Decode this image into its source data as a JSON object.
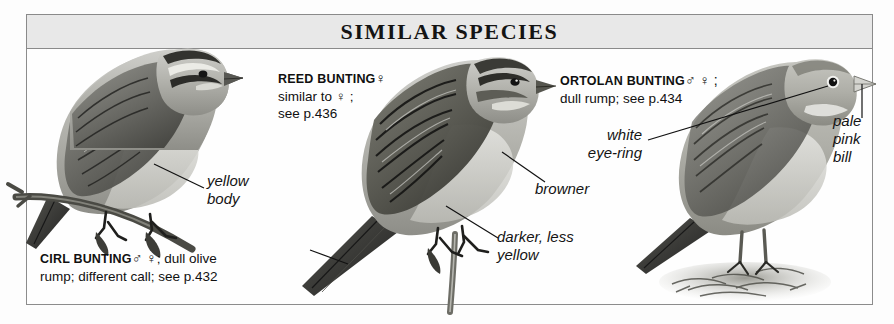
{
  "plate": {
    "header_title": "SIMILAR SPECIES",
    "frame_color": "#8c8c8c",
    "header_bg": "#e8e8e8",
    "page_bg": "#fdfdfd"
  },
  "species": [
    {
      "id": "cirl-bunting",
      "name": "CIRL BUNTING",
      "symbols": "♂ ♀",
      "note_line1": "; dull olive",
      "note_line2": "rump; different call; see p.432",
      "page_ref": "p.432"
    },
    {
      "id": "reed-bunting",
      "name": "REED BUNTING",
      "symbols": "♀",
      "note_line1": "similar to ♀ ;",
      "note_line2": "see p.436",
      "page_ref": "p.436"
    },
    {
      "id": "ortolan-bunting",
      "name": "ORTOLAN BUNTING",
      "symbols": "♂ ♀ ;",
      "note_line1": "dull rump; see p.434",
      "note_line2": "",
      "page_ref": "p.434"
    }
  ],
  "annotations": [
    {
      "id": "yellow-body",
      "line1": "yellow",
      "line2": "body"
    },
    {
      "id": "browner",
      "line1": "browner",
      "line2": ""
    },
    {
      "id": "darker-less-yellow",
      "line1": "darker, less",
      "line2": "yellow"
    },
    {
      "id": "white-eye-ring",
      "line1": "white",
      "line2": "eye-ring"
    },
    {
      "id": "pale-pink-bill",
      "line1": "pale",
      "line2": "pink",
      "line3": "bill"
    }
  ]
}
